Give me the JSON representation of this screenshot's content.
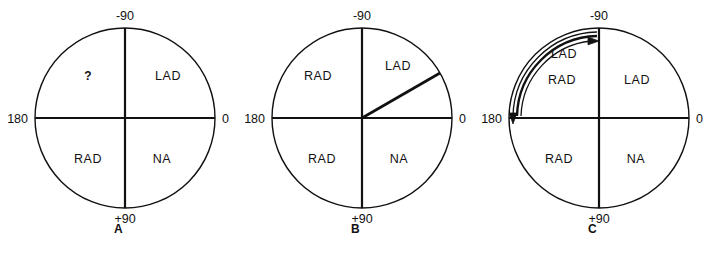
{
  "figure": {
    "type": "hexaxial-reference-circle-series",
    "background_color": "#ffffff",
    "line_color": "#111111",
    "panel_count": 3
  },
  "panels": [
    {
      "letter": "A",
      "center_x": 125,
      "center_y": 118,
      "radius": 90,
      "axis_labels": {
        "top": "-90",
        "right": "0",
        "bottom": "+90",
        "left": "180"
      },
      "quadrants": {
        "upper_left": "?",
        "upper_right": "LAD",
        "lower_left": "RAD",
        "lower_right": "NA"
      },
      "vector": null,
      "arcs": []
    },
    {
      "letter": "B",
      "center_x": 362,
      "center_y": 118,
      "radius": 90,
      "axis_labels": {
        "top": "-90",
        "right": "0",
        "bottom": "+90",
        "left": "180"
      },
      "quadrants": {
        "upper_left": "RAD",
        "upper_right": "LAD",
        "lower_left": "RAD",
        "lower_right": "NA"
      },
      "vector": {
        "angle_degrees": -30,
        "from": "center",
        "to": "circle-edge"
      },
      "arcs": []
    },
    {
      "letter": "C",
      "center_x": 599,
      "center_y": 118,
      "radius": 90,
      "axis_labels": {
        "top": "-90",
        "right": "0",
        "bottom": "+90",
        "left": "180"
      },
      "quadrants": {
        "upper_left": "RAD",
        "upper_right": "LAD",
        "lower_left": "RAD",
        "lower_right": "NA"
      },
      "vector": null,
      "arcs": [
        {
          "label": "LAD",
          "direction": "counterclockwise-to-180",
          "arrowhead_at": "180",
          "arrowhead_direction": "down",
          "radius": 86
        },
        {
          "label": "",
          "direction": "clockwise-to-minus-90",
          "arrowhead_at": "-90",
          "arrowhead_direction": "right",
          "radius": 78
        }
      ],
      "arc_label": "LAD"
    }
  ],
  "legend_terms": {
    "LAD": "LAD",
    "RAD": "RAD",
    "NA": "NA",
    "unknown": "?"
  }
}
